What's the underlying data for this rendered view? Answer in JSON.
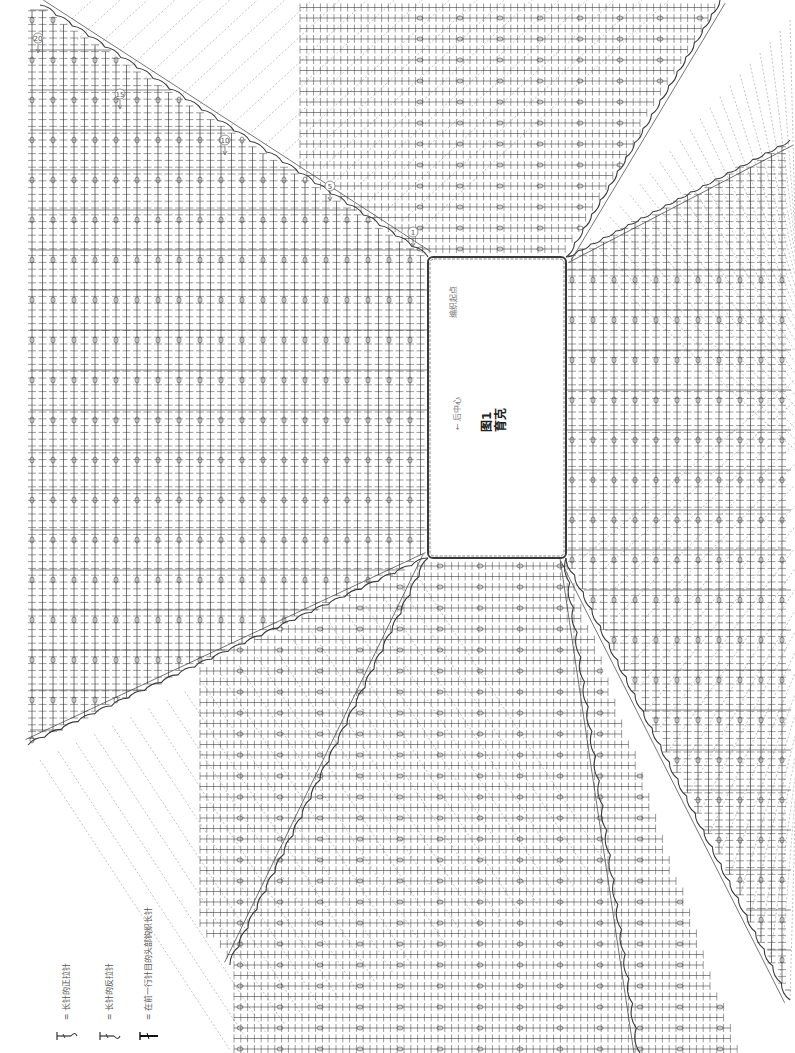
{
  "diagram": {
    "title_line1": "图1",
    "title_line2": "育克",
    "back_center_label": "后中心",
    "start_label": "编织起点",
    "row_markers": [
      {
        "label": "①",
        "x": 413,
        "y": 232
      },
      {
        "label": "⑤",
        "x": 330,
        "y": 186
      },
      {
        "label": "⑩",
        "x": 225,
        "y": 140
      },
      {
        "label": "⑮",
        "x": 120,
        "y": 94
      },
      {
        "label": "⑳",
        "x": 38,
        "y": 38
      }
    ],
    "center_rect": {
      "x": 428,
      "y": 257,
      "w": 138,
      "h": 301
    },
    "colors": {
      "ink": "#3a3a3a",
      "dash": "#9a9a9a",
      "label": "#777777"
    }
  },
  "legend": {
    "items": [
      {
        "symbol": "front-post-treble",
        "text": "= 长针的正拉针"
      },
      {
        "symbol": "back-post-treble",
        "text": "= 长针的反拉针"
      },
      {
        "symbol": "treble-in-top",
        "text": "= 在前一行针目的头部钩织长针"
      }
    ]
  }
}
